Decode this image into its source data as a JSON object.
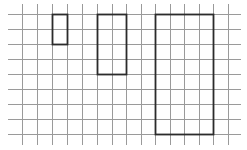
{
  "diagram": {
    "type": "grid-with-rectangles",
    "grid": {
      "cell_size": 14.6,
      "vertical_x": [
        22,
        37,
        52,
        67,
        82,
        97,
        112,
        126,
        141,
        155,
        170,
        184,
        199,
        213,
        228
      ],
      "horizontal_y": [
        14,
        29,
        44,
        59,
        74,
        89,
        104,
        119,
        134
      ],
      "h_extent": [
        8,
        241
      ],
      "v_extent": [
        4,
        145
      ],
      "line_color": "#9a9a9a"
    },
    "rectangles": [
      {
        "name": "small-rectangle",
        "x": 52,
        "y": 14,
        "w": 15,
        "h": 30,
        "cols": 1,
        "rows": 2
      },
      {
        "name": "medium-rectangle",
        "x": 97,
        "y": 14,
        "w": 29,
        "h": 60,
        "cols": 2,
        "rows": 4
      },
      {
        "name": "large-rectangle",
        "x": 155,
        "y": 14,
        "w": 58,
        "h": 120,
        "cols": 4,
        "rows": 8
      }
    ],
    "rectangle_color": "#2b2b2b"
  }
}
